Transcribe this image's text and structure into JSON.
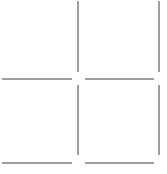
{
  "grid": {
    "rows": 2,
    "cols": 2,
    "line_color": "#9e9e9e",
    "background": "#ffffff",
    "cells": [
      {
        "row": 0,
        "col": 0
      },
      {
        "row": 0,
        "col": 1
      },
      {
        "row": 1,
        "col": 0
      },
      {
        "row": 1,
        "col": 1
      }
    ]
  }
}
